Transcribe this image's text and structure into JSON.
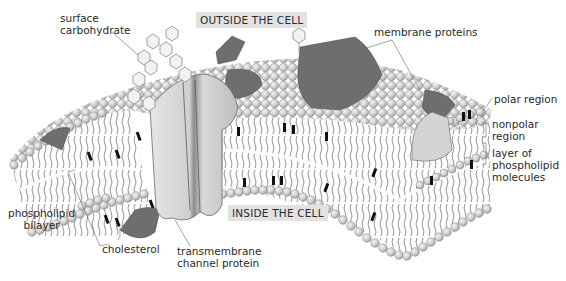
{
  "diagram": {
    "regions": {
      "outside": "OUTSIDE THE CELL",
      "inside": "INSIDE THE CELL"
    },
    "labels": {
      "surface_carbohydrate": [
        "surface",
        "carbohydrate"
      ],
      "membrane_proteins": "membrane proteins",
      "polar_region": "polar region",
      "nonpolar_region": [
        "nonpolar",
        "region"
      ],
      "layer_of_phospholipid": [
        "layer of",
        "phospholipid",
        "molecules"
      ],
      "phospholipid_bilayer": [
        "phospholipid",
        "bilayer"
      ],
      "cholesterol": "cholesterol",
      "transmembrane_channel_protein": [
        "transmembrane",
        "channel protein"
      ]
    },
    "colors": {
      "protein_dark": "#6e6e6e",
      "protein_light": "#d4d4d4",
      "head_fill": "#cfcfcf",
      "head_stroke": "#7a7a7a",
      "tail": "#4a4a4a",
      "cholesterol": "#111111",
      "region_bg": "#e2e2e2"
    }
  }
}
